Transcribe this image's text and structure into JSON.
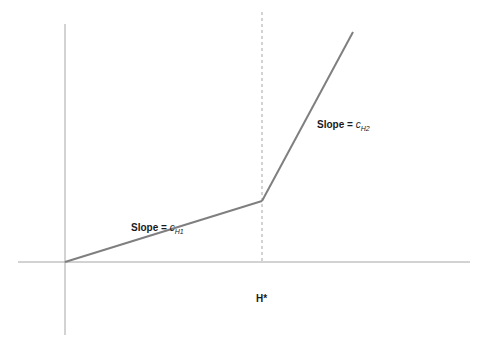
{
  "diagram": {
    "type": "piecewise-linear",
    "colors": {
      "axis": "#a6a6a6",
      "line": "#7f7f7f",
      "dashed": "#a6a6a6",
      "text": "#1a1a1a"
    },
    "labels": {
      "segment1": {
        "prefix": "Slope = ",
        "coef": "c",
        "sub": "H1"
      },
      "segment2": {
        "prefix": "Slope = ",
        "coef": "c",
        "sub": "H2"
      },
      "threshold": "H*"
    },
    "points": {
      "origin": [
        65,
        262
      ],
      "kink": [
        262,
        201
      ],
      "end": [
        353,
        32
      ]
    }
  }
}
